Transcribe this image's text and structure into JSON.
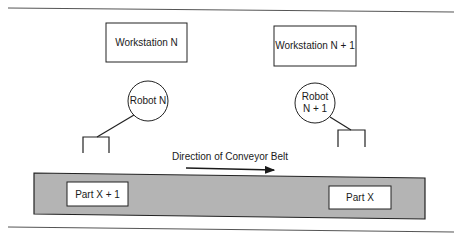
{
  "diagram": {
    "workstations": [
      {
        "label": "Workstation N"
      },
      {
        "label": "Workstation N + 1"
      }
    ],
    "robots": [
      {
        "label_lines": [
          "Robot N"
        ]
      },
      {
        "label_lines": [
          "Robot",
          "N + 1"
        ]
      }
    ],
    "conveyor": {
      "direction_label": "Direction of Conveyor Belt",
      "direction": "right",
      "fill_color": "#b4b4b4"
    },
    "parts": [
      {
        "label": "Part X + 1"
      },
      {
        "label": "Part X"
      }
    ]
  }
}
